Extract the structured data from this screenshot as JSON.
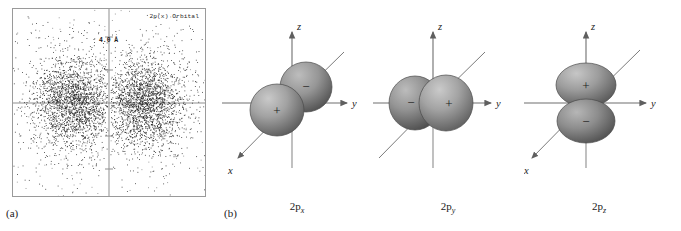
{
  "figure": {
    "panel_a": {
      "letter": "(a)",
      "plot_title": "2p(x) Orbital",
      "scale_label": "4.0 Å",
      "axis_color": "#8a8a8a",
      "dot_color": "#151515"
    },
    "panel_b": {
      "letter": "(b)",
      "orbitals": [
        {
          "name": "2p-x",
          "caption_prefix": "2p",
          "caption_subscript": "x",
          "axes": [
            {
              "name": "z-axis-label",
              "label": "z"
            },
            {
              "name": "y-axis-label",
              "label": "y"
            },
            {
              "name": "x-axis-label",
              "label": "x"
            }
          ],
          "lobes": [
            {
              "sign": "+",
              "position": "front-lower-left"
            },
            {
              "sign": "−",
              "position": "back-upper-right"
            }
          ]
        },
        {
          "name": "2p-y",
          "caption_prefix": "2p",
          "caption_subscript": "y",
          "axes": [
            {
              "name": "z-axis-label",
              "label": "z"
            },
            {
              "name": "y-axis-label",
              "label": "y"
            },
            {
              "name": "x-axis-label",
              "label": "x"
            }
          ],
          "lobes": [
            {
              "sign": "−",
              "position": "left"
            },
            {
              "sign": "+",
              "position": "right"
            }
          ]
        },
        {
          "name": "2p-z",
          "caption_prefix": "2p",
          "caption_subscript": "z",
          "axes": [
            {
              "name": "z-axis-label",
              "label": "z"
            },
            {
              "name": "y-axis-label",
              "label": "y"
            },
            {
              "name": "x-axis-label",
              "label": "x"
            }
          ],
          "lobes": [
            {
              "sign": "+",
              "position": "top"
            },
            {
              "sign": "−",
              "position": "bottom"
            }
          ]
        }
      ],
      "lobe_fill_light": "#b9b9b9",
      "lobe_fill_dark": "#5d5d5d",
      "axis_color": "#6e6e6e"
    }
  },
  "chart_data": {
    "type": "scatter",
    "title": "2p(x) Orbital",
    "xlabel": "",
    "ylabel": "",
    "annotation": "4.0 Å",
    "axis_lines": {
      "horizontal": 0,
      "vertical": 0
    },
    "grid": false,
    "legend": false,
    "xlim": [
      -2.6,
      2.6
    ],
    "ylim": [
      -2.6,
      2.6
    ],
    "n_points": 5200,
    "lobe_centers": [
      [
        -0.95,
        0.0
      ],
      [
        0.95,
        0.0
      ]
    ],
    "lobe_sigma": [
      0.52,
      0.62
    ],
    "tick_positions_y": [
      -1.8,
      -0.9,
      0.9,
      1.8
    ],
    "scale_bar_value": 4.0,
    "scale_bar_units": "Å"
  }
}
